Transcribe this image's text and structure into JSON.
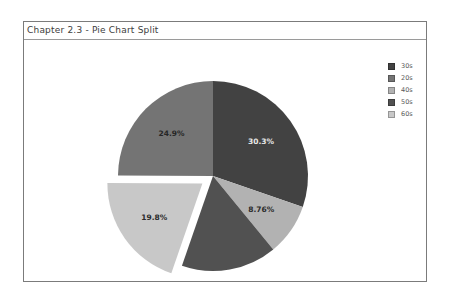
{
  "panel": {
    "title": "Chapter 2.3 - Pie Chart Split"
  },
  "chart_data": {
    "type": "pie",
    "title": "Chapter 2.3 - Pie Chart Split",
    "direction": "clockwise",
    "start_angle": "12-o'clock",
    "slices": [
      {
        "category": "30s",
        "value": 30.3,
        "label": "30.3%",
        "color": "#424242",
        "label_color": "#e8e8e8",
        "exploded": false
      },
      {
        "category": "40s",
        "value": 8.76,
        "label": "8.76%",
        "color": "#b2b2b2",
        "label_color": "#2b2b2b",
        "exploded": false
      },
      {
        "category": "50s",
        "value": 16.24,
        "label": "",
        "color": "#515151",
        "label_color": "#2b2b2b",
        "exploded": false
      },
      {
        "category": "60s",
        "value": 19.8,
        "label": "19.8%",
        "color": "#c8c8c8",
        "label_color": "#2b2b2b",
        "exploded": true
      },
      {
        "category": "20s",
        "value": 24.9,
        "label": "24.9%",
        "color": "#747474",
        "label_color": "#262626",
        "exploded": false
      }
    ],
    "legend": {
      "position": "top-right",
      "items": [
        {
          "label": "30s",
          "color": "#424242"
        },
        {
          "label": "20s",
          "color": "#747474"
        },
        {
          "label": "40s",
          "color": "#b2b2b2"
        },
        {
          "label": "50s",
          "color": "#515151"
        },
        {
          "label": "60s",
          "color": "#c8c8c8"
        }
      ]
    }
  }
}
